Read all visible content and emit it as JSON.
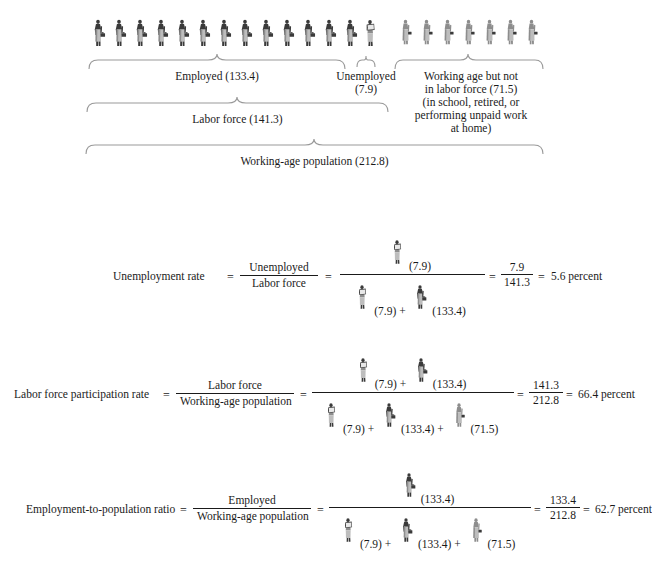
{
  "figure": {
    "units_note": "millions of people"
  },
  "population_breakdown": {
    "employed": {
      "label": "Employed (133.4)",
      "value": 133.4,
      "icon_count": 13,
      "icon": "person-employed-icon"
    },
    "unemployed": {
      "label": "Unemployed",
      "value_label": "(7.9)",
      "value": 7.9,
      "icon_count": 1,
      "icon": "person-unemployed-icon"
    },
    "not_in_labor_force": {
      "line1": "Working age but not",
      "line2": "in labor force (71.5)",
      "line3": "(in school, retired, or",
      "line4": "performing unpaid work",
      "line5": "at home)",
      "value": 71.5,
      "icon_count": 7,
      "icon": "person-notinlaborforce-icon"
    },
    "labor_force": {
      "label": "Labor force (141.3)",
      "value": 141.3
    },
    "working_age_population": {
      "label": "Working-age population (212.8)",
      "value": 212.8
    }
  },
  "equations": [
    {
      "id": "unemployment-rate",
      "name": "Unemployment rate",
      "equals": "=",
      "numerator_text": "Unemployed",
      "denominator_text": "Labor force",
      "equals2": "=",
      "pic_numerator": [
        {
          "icon": "person-unemployed-icon",
          "value": "(7.9)"
        }
      ],
      "pic_denominator": [
        {
          "icon": "person-unemployed-icon",
          "value": "(7.9) +"
        },
        {
          "icon": "person-employed-icon",
          "value": "(133.4)"
        }
      ],
      "equals3": "=",
      "num_value": "7.9",
      "den_value": "141.3",
      "equals4": "=",
      "result": "5.6 percent"
    },
    {
      "id": "labor-force-participation-rate",
      "name": "Labor force participation rate",
      "equals": "=",
      "numerator_text": "Labor force",
      "denominator_text": "Working-age population",
      "equals2": "=",
      "pic_numerator": [
        {
          "icon": "person-unemployed-icon",
          "value": "(7.9) +"
        },
        {
          "icon": "person-employed-icon",
          "value": "(133.4)"
        }
      ],
      "pic_denominator": [
        {
          "icon": "person-unemployed-icon",
          "value": "(7.9) +"
        },
        {
          "icon": "person-employed-icon",
          "value": "(133.4) +"
        },
        {
          "icon": "person-notinlaborforce-icon",
          "value": "(71.5)"
        }
      ],
      "equals3": "=",
      "num_value": "141.3",
      "den_value": "212.8",
      "equals4": "=",
      "result": "66.4 percent"
    },
    {
      "id": "employment-to-population-ratio",
      "name": "Employment-to-population ratio",
      "equals": "=",
      "numerator_text": "Employed",
      "denominator_text": "Working-age population",
      "equals2": "=",
      "pic_numerator": [
        {
          "icon": "person-employed-icon",
          "value": "(133.4)"
        }
      ],
      "pic_denominator": [
        {
          "icon": "person-unemployed-icon",
          "value": "(7.9) +"
        },
        {
          "icon": "person-employed-icon",
          "value": "(133.4) +"
        },
        {
          "icon": "person-notinlaborforce-icon",
          "value": "(71.5)"
        }
      ],
      "equals3": "=",
      "num_value": "133.4",
      "den_value": "212.8",
      "equals4": "=",
      "result": "62.7 percent"
    }
  ],
  "colors": {
    "background": "#ffffff",
    "ink": "#1a1a1a",
    "figure_dark": "#3a3a3a",
    "figure_mid": "#8d8d8d",
    "figure_light": "#bdbdbd",
    "brace": "#9a9a9a"
  }
}
